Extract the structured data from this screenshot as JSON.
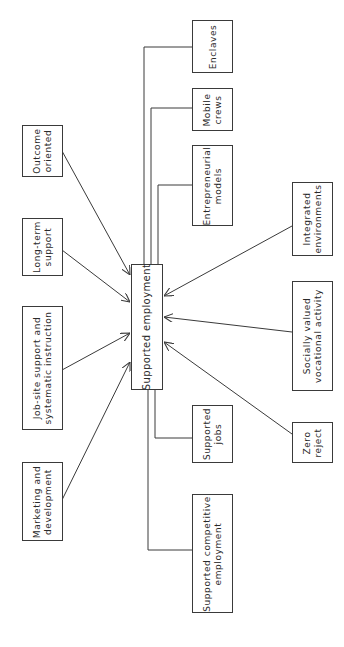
{
  "diagram": {
    "center": {
      "label": "Supported employment"
    },
    "inputs_left": [
      {
        "label": "Outcome\noriented"
      },
      {
        "label": "Long-term\nsupport"
      },
      {
        "label": "Job-site support and\nsystematic instruction"
      },
      {
        "label": "Marketing and\ndevelopment"
      }
    ],
    "inputs_right": [
      {
        "label": "Integrated\nenvironments"
      },
      {
        "label": "Socially valued\nvocational activity"
      },
      {
        "label": "Zero\nreject"
      }
    ],
    "models": [
      {
        "label": "Enclaves"
      },
      {
        "label": "Mobile\ncrews"
      },
      {
        "label": "Entrepreneurial\nmodels"
      },
      {
        "label": "Supported\njobs"
      },
      {
        "label": "Supported competitive\nemployment"
      }
    ]
  }
}
